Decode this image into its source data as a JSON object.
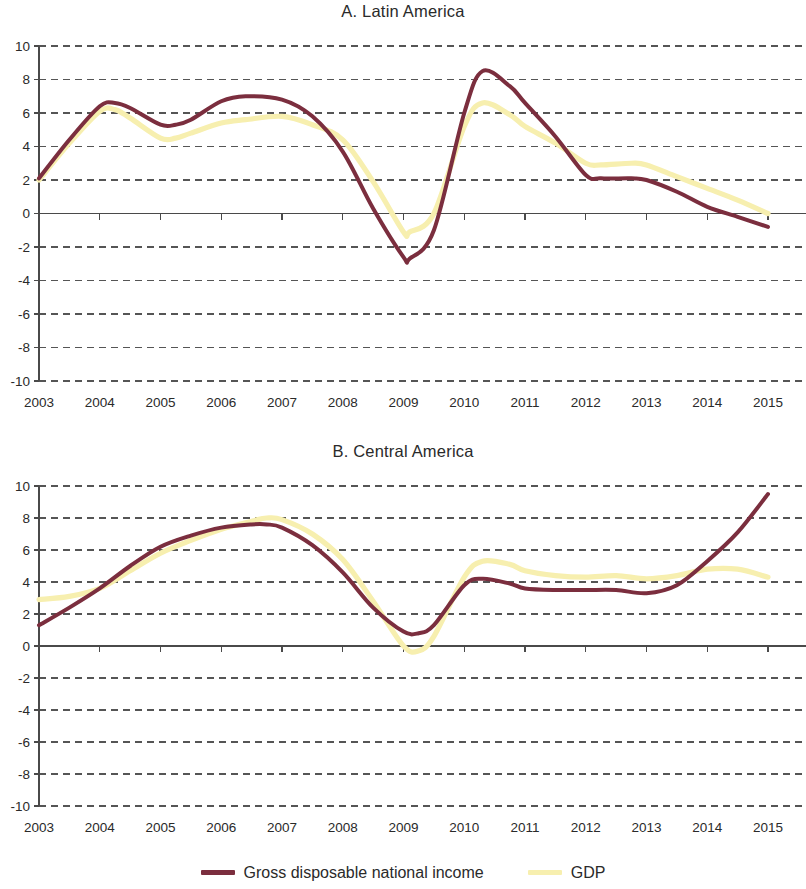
{
  "legend": {
    "items": [
      {
        "label": "Gross disposable national income",
        "color": "#7B2E3E",
        "key": "gdni"
      },
      {
        "label": "GDP",
        "color": "#F7EFAF",
        "key": "gdp"
      }
    ]
  },
  "colors": {
    "gdni": "#7B2E3E",
    "gdp": "#F7EFAF",
    "axis": "#555555",
    "grid": "#555555",
    "text": "#2a2a2a"
  },
  "panels": [
    {
      "id": "a",
      "title": "A. Latin America"
    },
    {
      "id": "b",
      "title": "B. Central America"
    }
  ],
  "chart_data": [
    {
      "type": "line",
      "title": "A. Latin America",
      "xlabel": "",
      "ylabel": "",
      "xlim": [
        2003,
        2015
      ],
      "ylim": [
        -10,
        10
      ],
      "yticks": [
        10,
        8,
        6,
        4,
        2,
        0,
        -2,
        -4,
        -6,
        -8,
        -10
      ],
      "xticks": [
        2003,
        2004,
        2005,
        2006,
        2007,
        2008,
        2009,
        2010,
        2011,
        2012,
        2013,
        2014,
        2015
      ],
      "grid": true,
      "legend_position": "bottom",
      "x": [
        2003,
        2003.5,
        2004,
        2004.25,
        2004.5,
        2005,
        2005.25,
        2005.5,
        2006,
        2006.4,
        2007,
        2007.5,
        2008,
        2008.5,
        2009,
        2009.1,
        2009.5,
        2010,
        2010.3,
        2010.75,
        2011,
        2011.5,
        2012,
        2012.25,
        2012.75,
        2013,
        2013.5,
        2014,
        2014.5,
        2015
      ],
      "series": [
        {
          "name": "Gross disposable national income",
          "color": "#7B2E3E",
          "values": [
            2.1,
            4.4,
            6.4,
            6.6,
            6.3,
            5.3,
            5.3,
            5.6,
            6.7,
            7.0,
            6.8,
            5.8,
            3.7,
            0.3,
            -2.6,
            -2.7,
            -1.0,
            6.0,
            8.5,
            7.6,
            6.6,
            4.6,
            2.3,
            2.1,
            2.1,
            2.0,
            1.3,
            0.4,
            -0.2,
            -0.8
          ]
        },
        {
          "name": "GDP",
          "color": "#F7EFAF",
          "values": [
            2.0,
            4.2,
            6.1,
            6.2,
            5.7,
            4.5,
            4.5,
            4.8,
            5.4,
            5.6,
            5.8,
            5.3,
            4.4,
            1.9,
            -1.1,
            -1.1,
            0.0,
            5.2,
            6.6,
            5.9,
            5.2,
            4.2,
            3.0,
            2.9,
            3.0,
            2.9,
            2.2,
            1.5,
            0.8,
            0.0
          ]
        }
      ]
    },
    {
      "type": "line",
      "title": "B. Central America",
      "xlabel": "",
      "ylabel": "",
      "xlim": [
        2003,
        2015
      ],
      "ylim": [
        -10,
        10
      ],
      "yticks": [
        10,
        8,
        6,
        4,
        2,
        0,
        -2,
        -4,
        -6,
        -8,
        -10
      ],
      "xticks": [
        2003,
        2004,
        2005,
        2006,
        2007,
        2008,
        2009,
        2010,
        2011,
        2012,
        2013,
        2014,
        2015
      ],
      "grid": true,
      "legend_position": "bottom",
      "x": [
        2003,
        2003.5,
        2004,
        2004.5,
        2005,
        2005.5,
        2006,
        2006.5,
        2006.75,
        2007,
        2007.5,
        2008,
        2008.5,
        2009,
        2009.25,
        2009.5,
        2010,
        2010.3,
        2010.75,
        2011,
        2011.5,
        2012,
        2012.5,
        2013,
        2013.5,
        2014,
        2014.5,
        2015
      ],
      "series": [
        {
          "name": "Gross disposable national income",
          "color": "#7B2E3E",
          "values": [
            1.3,
            2.4,
            3.6,
            5.0,
            6.2,
            6.9,
            7.4,
            7.6,
            7.6,
            7.4,
            6.3,
            4.6,
            2.4,
            0.9,
            0.8,
            1.3,
            3.8,
            4.2,
            3.9,
            3.6,
            3.5,
            3.5,
            3.5,
            3.3,
            3.8,
            5.3,
            7.1,
            9.5
          ]
        },
        {
          "name": "GDP",
          "color": "#F7EFAF",
          "values": [
            2.9,
            3.1,
            3.6,
            4.7,
            5.8,
            6.6,
            7.3,
            7.8,
            8.0,
            7.9,
            7.0,
            5.4,
            2.8,
            0.0,
            -0.3,
            0.6,
            4.3,
            5.3,
            5.1,
            4.7,
            4.4,
            4.3,
            4.4,
            4.2,
            4.4,
            4.8,
            4.8,
            4.3
          ]
        }
      ]
    }
  ]
}
